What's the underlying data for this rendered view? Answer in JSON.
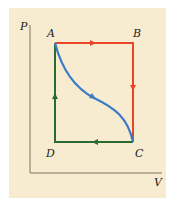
{
  "diagram": {
    "type": "PV diagram",
    "axes": {
      "y_label": "P",
      "x_label": "V"
    },
    "points": [
      {
        "label": "A",
        "position": "top-left"
      },
      {
        "label": "B",
        "position": "top-right"
      },
      {
        "label": "C",
        "position": "bottom-right"
      },
      {
        "label": "D",
        "position": "bottom-left"
      }
    ],
    "paths": [
      {
        "name": "A-B-C",
        "color": "#e8452a",
        "direction": "A to B to C"
      },
      {
        "name": "C-D-A",
        "color": "#2b6b2f",
        "direction": "C to D to A"
      },
      {
        "name": "A-C curve",
        "color": "#3b7cc6",
        "direction": "A to C"
      }
    ],
    "colors": {
      "background": "#f8ecd0",
      "axis": "#7a7266"
    }
  }
}
